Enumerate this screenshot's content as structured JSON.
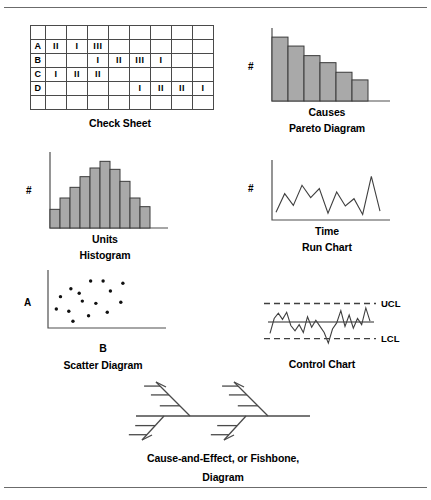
{
  "page": {
    "divider_color": "#6b6b6b",
    "bar_fill": "#a9a9a9",
    "line_color": "#3f3f3f"
  },
  "figures": {
    "check_sheet": {
      "caption": "Check Sheet",
      "columns": 9,
      "rows": 6,
      "row_labels": [
        "",
        "A",
        "B",
        "C",
        "D",
        ""
      ],
      "cells": [
        [
          "",
          "",
          "",
          "",
          "",
          "",
          "",
          "",
          ""
        ],
        [
          "A",
          "II",
          "I",
          "III",
          "",
          "",
          "",
          "",
          ""
        ],
        [
          "B",
          "",
          "",
          "I",
          "II",
          "III",
          "I",
          "",
          ""
        ],
        [
          "C",
          "I",
          "II",
          "II",
          "",
          "",
          "",
          "",
          ""
        ],
        [
          "D",
          "",
          "",
          "",
          "",
          "I",
          "II",
          "II",
          "I"
        ],
        [
          "",
          "",
          "",
          "",
          "",
          "",
          "",
          "",
          ""
        ]
      ]
    },
    "pareto": {
      "caption_line1": "Causes",
      "caption_line2": "Pareto Diagram",
      "y_axis_label": "#",
      "x_axis_label": "Causes"
    },
    "histogram": {
      "caption_line1": "Units",
      "caption_line2": "Histogram",
      "y_axis_label": "#",
      "x_axis_label": "Units"
    },
    "run_chart": {
      "caption_line1": "Time",
      "caption_line2": "Run Chart",
      "y_axis_label": "#",
      "x_axis_label": "Time"
    },
    "scatter": {
      "caption": "Scatter Diagram",
      "y_axis_label": "A",
      "x_axis_label": "B"
    },
    "control_chart": {
      "caption": "Control Chart",
      "upper_limit_label": "UCL",
      "lower_limit_label": "LCL"
    },
    "fishbone": {
      "caption_line1": "Cause-and-Effect, or Fishbone,",
      "caption_line2": "Diagram"
    }
  },
  "chart_data": [
    {
      "type": "bar",
      "name": "pareto",
      "title": "Pareto Diagram",
      "xlabel": "Causes",
      "ylabel": "#",
      "categories": [
        "1",
        "2",
        "3",
        "4",
        "5",
        "6"
      ],
      "values": [
        100,
        86,
        71,
        60,
        45,
        33
      ],
      "ylim": [
        0,
        108
      ],
      "grid": false,
      "legend": "none"
    },
    {
      "type": "bar",
      "name": "histogram",
      "title": "Histogram",
      "xlabel": "Units",
      "ylabel": "#",
      "categories": [
        "1",
        "2",
        "3",
        "4",
        "5",
        "6",
        "7",
        "8",
        "9",
        "10"
      ],
      "values": [
        28,
        45,
        61,
        77,
        90,
        100,
        88,
        70,
        45,
        32
      ],
      "ylim": [
        0,
        108
      ],
      "grid": false,
      "legend": "none"
    },
    {
      "type": "line",
      "name": "run_chart",
      "title": "Run Chart",
      "xlabel": "Time",
      "ylabel": "#",
      "x": [
        0,
        1,
        2,
        3,
        4,
        5,
        6,
        7,
        8,
        9,
        10,
        11,
        12
      ],
      "values": [
        14,
        47,
        26,
        62,
        40,
        56,
        12,
        50,
        25,
        38,
        10,
        78,
        16
      ],
      "ylim": [
        0,
        100
      ],
      "grid": false,
      "legend": "none"
    },
    {
      "type": "scatter",
      "name": "scatter_diagram",
      "title": "Scatter Diagram",
      "xlabel": "B",
      "ylabel": "A",
      "points": [
        [
          30,
          62
        ],
        [
          41,
          84
        ],
        [
          53,
          84
        ],
        [
          22,
          70
        ],
        [
          72,
          80
        ],
        [
          12,
          56
        ],
        [
          60,
          66
        ],
        [
          33,
          48
        ],
        [
          8,
          34
        ],
        [
          46,
          44
        ],
        [
          20,
          30
        ],
        [
          57,
          28
        ],
        [
          39,
          22
        ],
        [
          24,
          12
        ],
        [
          70,
          46
        ]
      ],
      "xlim": [
        0,
        100
      ],
      "ylim": [
        0,
        100
      ],
      "grid": false,
      "legend": "none"
    },
    {
      "type": "line",
      "name": "control_chart",
      "title": "Control Chart",
      "xlabel": "",
      "ylabel": "",
      "center_line": 50,
      "upper_control_limit": 92,
      "lower_control_limit": 12,
      "values": [
        24,
        58,
        70,
        56,
        72,
        42,
        30,
        44,
        26,
        62,
        38,
        54,
        40,
        26,
        2,
        34,
        48,
        76,
        40,
        66,
        36,
        58,
        44,
        82,
        52
      ],
      "ylim": [
        0,
        100
      ],
      "grid": false,
      "legend": "none"
    }
  ]
}
